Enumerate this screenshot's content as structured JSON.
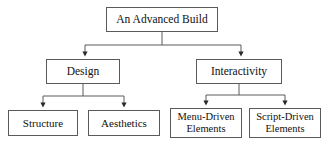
{
  "diagram": {
    "type": "hierarchy-tree",
    "title": "An Advanced Build",
    "background_color": "#ffffff",
    "border_color": "#5a5a5a",
    "text_color": "#101010",
    "nodes": {
      "root": {
        "label": "An Advanced Build"
      },
      "design": {
        "label": "Design"
      },
      "interactivity": {
        "label": "Interactivity"
      },
      "structure": {
        "label": "Structure"
      },
      "aesthetics": {
        "label": "Aesthetics"
      },
      "menu_driven": {
        "label": "Menu-Driven\nElements"
      },
      "script_driven": {
        "label": "Script-Driven\nElements"
      }
    },
    "edges": [
      {
        "from": "root",
        "to": "design"
      },
      {
        "from": "root",
        "to": "interactivity"
      },
      {
        "from": "design",
        "to": "structure"
      },
      {
        "from": "design",
        "to": "aesthetics"
      },
      {
        "from": "interactivity",
        "to": "menu_driven"
      },
      {
        "from": "interactivity",
        "to": "script_driven"
      }
    ]
  }
}
